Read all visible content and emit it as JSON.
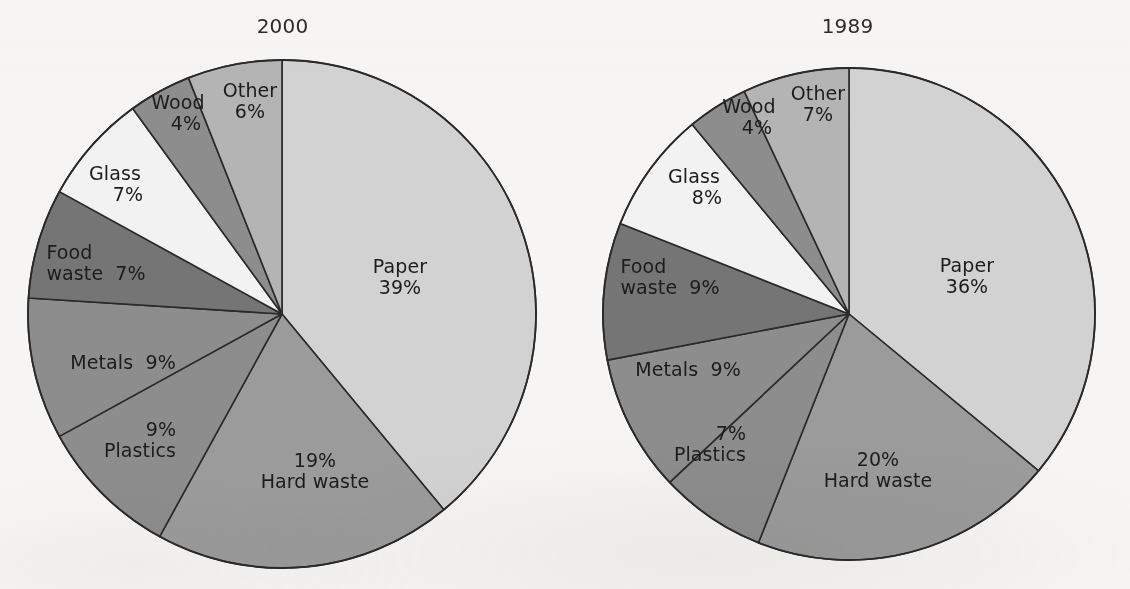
{
  "figure": {
    "background_color": "#f6f5f3",
    "text_color": "#1c1c1c",
    "outline_color": "#2a2a2a"
  },
  "chart_data": [
    {
      "type": "pie",
      "title": "2000",
      "start_angle_deg": 0,
      "direction": "clockwise",
      "center": {
        "x": 282,
        "y": 314
      },
      "radius": 254,
      "categories": [
        "Paper",
        "Hard waste",
        "Plastics",
        "Metals",
        "Food waste",
        "Glass",
        "Wood",
        "Other"
      ],
      "values": [
        39,
        19,
        9,
        9,
        7,
        7,
        4,
        6
      ],
      "value_labels": [
        "39%",
        "19%",
        "9%",
        "9%",
        "7%",
        "7%",
        "4%",
        "6%"
      ],
      "colors": [
        "#d2d2d2",
        "#9b9b9b",
        "#8d8d8d",
        "#8d8d8d",
        "#757575",
        "#f2f2f2",
        "#8d8d8d",
        "#b4b4b4"
      ],
      "slices": [
        {
          "name": "Paper",
          "percent": 39,
          "label": "Paper",
          "value_label": "39%",
          "color": "#d2d2d2",
          "label_layout": "stacked",
          "label_x": 400,
          "label_y": 277
        },
        {
          "name": "Hard waste",
          "percent": 19,
          "label": "Hard waste",
          "value_label": "19%",
          "color": "#9b9b9b",
          "label_layout": "value-above",
          "label_x": 315,
          "label_y": 471
        },
        {
          "name": "Plastics",
          "percent": 9,
          "label": "Plastics",
          "value_label": "9%",
          "color": "#8d8d8d",
          "label_layout": "value-above-offset",
          "label_x": 140,
          "label_y": 440
        },
        {
          "name": "Metals",
          "percent": 9,
          "label": "Metals",
          "value_label": "9%",
          "color": "#8d8d8d",
          "label_layout": "inline",
          "label_x": 123,
          "label_y": 363
        },
        {
          "name": "Food waste",
          "percent": 7,
          "label": "Food\nwaste",
          "value_label": "7%",
          "color": "#757575",
          "label_layout": "inline-wrapped",
          "label_x": 96,
          "label_y": 263
        },
        {
          "name": "Glass",
          "percent": 7,
          "label": "Glass",
          "value_label": "7%",
          "color": "#f2f2f2",
          "label_layout": "stacked-offset",
          "label_x": 115,
          "label_y": 184
        },
        {
          "name": "Wood",
          "percent": 4,
          "label": "Wood",
          "value_label": "4%",
          "color": "#8d8d8d",
          "label_layout": "stacked-offset2",
          "label_x": 178,
          "label_y": 113
        },
        {
          "name": "Other",
          "percent": 6,
          "label": "Other",
          "value_label": "6%",
          "color": "#b4b4b4",
          "label_layout": "stacked",
          "label_x": 250,
          "label_y": 101
        }
      ]
    },
    {
      "type": "pie",
      "title": "1989",
      "start_angle_deg": 0,
      "direction": "clockwise",
      "center": {
        "x": 849,
        "y": 314
      },
      "radius": 246,
      "categories": [
        "Paper",
        "Hard waste",
        "Plastics",
        "Metals",
        "Food waste",
        "Glass",
        "Wood",
        "Other"
      ],
      "values": [
        36,
        20,
        7,
        9,
        9,
        8,
        4,
        7
      ],
      "value_labels": [
        "36%",
        "20%",
        "7%",
        "9%",
        "9%",
        "8%",
        "4%",
        "7%"
      ],
      "colors": [
        "#d2d2d2",
        "#9b9b9b",
        "#8d8d8d",
        "#8d8d8d",
        "#757575",
        "#f2f2f2",
        "#8d8d8d",
        "#b4b4b4"
      ],
      "slices": [
        {
          "name": "Paper",
          "percent": 36,
          "label": "Paper",
          "value_label": "36%",
          "color": "#d2d2d2",
          "label_layout": "stacked",
          "label_x": 967,
          "label_y": 276
        },
        {
          "name": "Hard waste",
          "percent": 20,
          "label": "Hard waste",
          "value_label": "20%",
          "color": "#9b9b9b",
          "label_layout": "value-above",
          "label_x": 878,
          "label_y": 470
        },
        {
          "name": "Plastics",
          "percent": 7,
          "label": "Plastics",
          "value_label": "7%",
          "color": "#8d8d8d",
          "label_layout": "value-above-offset",
          "label_x": 710,
          "label_y": 444
        },
        {
          "name": "Metals",
          "percent": 9,
          "label": "Metals",
          "value_label": "9%",
          "color": "#8d8d8d",
          "label_layout": "inline",
          "label_x": 688,
          "label_y": 370
        },
        {
          "name": "Food waste",
          "percent": 9,
          "label": "Food\nwaste",
          "value_label": "9%",
          "color": "#757575",
          "label_layout": "inline-wrapped",
          "label_x": 670,
          "label_y": 277
        },
        {
          "name": "Glass",
          "percent": 8,
          "label": "Glass",
          "value_label": "8%",
          "color": "#f2f2f2",
          "label_layout": "stacked-offset",
          "label_x": 694,
          "label_y": 187
        },
        {
          "name": "Wood",
          "percent": 4,
          "label": "Wood",
          "value_label": "4%",
          "color": "#8d8d8d",
          "label_layout": "stacked-offset2",
          "label_x": 749,
          "label_y": 117
        },
        {
          "name": "Other",
          "percent": 7,
          "label": "Other",
          "value_label": "7%",
          "color": "#b4b4b4",
          "label_layout": "stacked",
          "label_x": 818,
          "label_y": 104
        }
      ]
    }
  ]
}
